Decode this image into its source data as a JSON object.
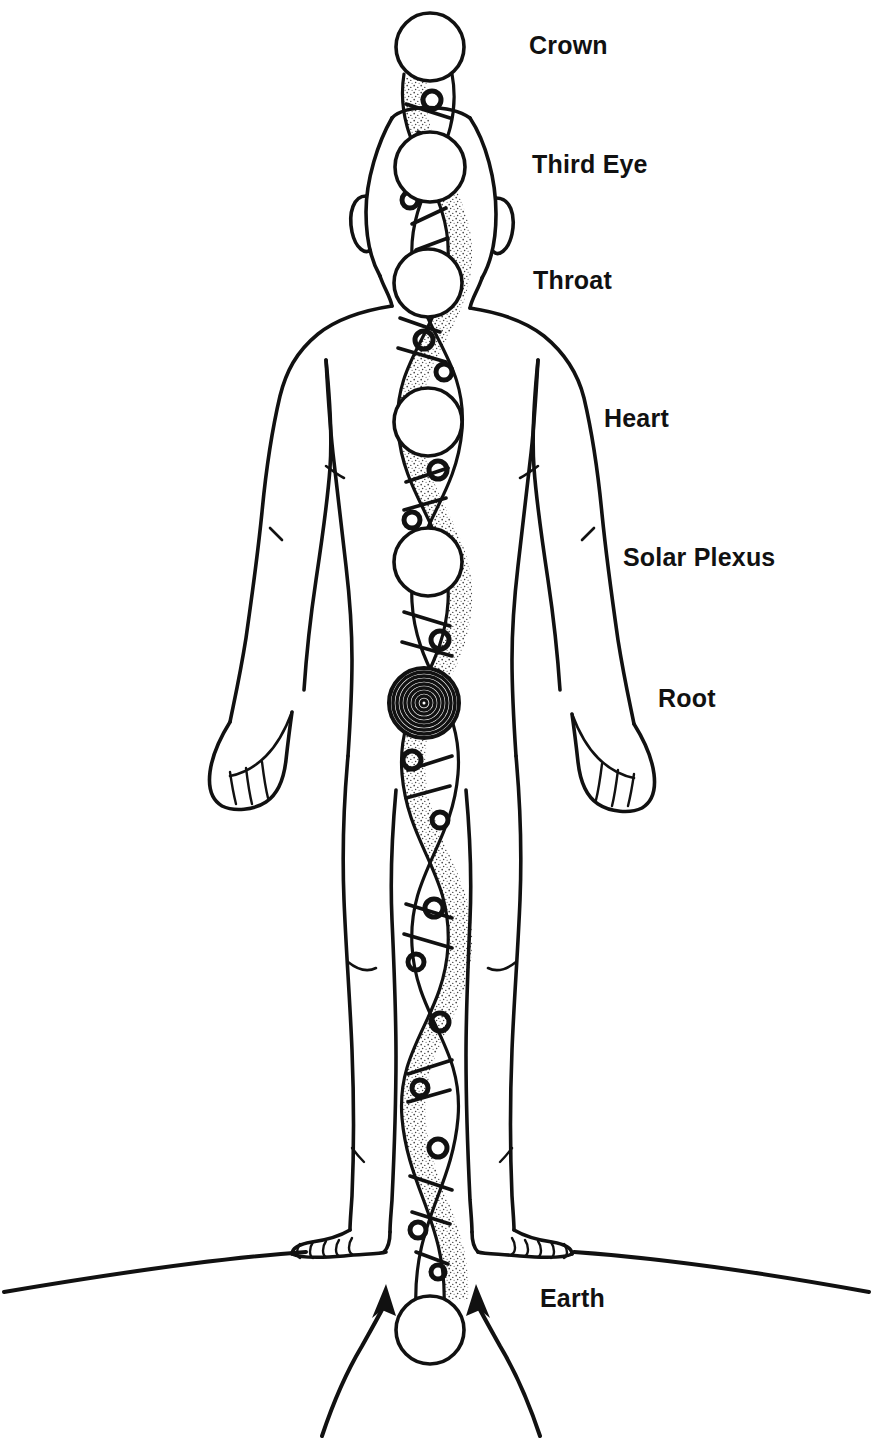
{
  "diagram": {
    "background_color": "#ffffff",
    "ink_color": "#111111"
  },
  "labels": {
    "crown": "Crown",
    "third_eye": "Third Eye",
    "throat": "Throat",
    "heart": "Heart",
    "solar_plexus": "Solar Plexus",
    "root": "Root",
    "earth": "Earth"
  },
  "chakras": [
    {
      "name": "Crown",
      "label": "Crown",
      "marker": "open-circle",
      "cx": 430,
      "cy": 47,
      "r": 34,
      "label_x": 529,
      "label_y": 33
    },
    {
      "name": "Third Eye",
      "label": "Third Eye",
      "marker": "open-circle",
      "cx": 430,
      "cy": 167,
      "r": 35,
      "label_x": 532,
      "label_y": 152
    },
    {
      "name": "Throat",
      "label": "Throat",
      "marker": "open-circle",
      "cx": 428,
      "cy": 283,
      "r": 34,
      "label_x": 533,
      "label_y": 268
    },
    {
      "name": "Heart",
      "label": "Heart",
      "marker": "open-circle",
      "cx": 428,
      "cy": 422,
      "r": 34,
      "label_x": 604,
      "label_y": 406
    },
    {
      "name": "Solar Plexus",
      "label": "Solar Plexus",
      "marker": "open-circle",
      "cx": 428,
      "cy": 562,
      "r": 34,
      "label_x": 623,
      "label_y": 545
    },
    {
      "name": "Root",
      "label": "Root",
      "marker": "concentric-rings",
      "cx": 424,
      "cy": 703,
      "r": 34,
      "label_x": 658,
      "label_y": 686,
      "ring_count": 8
    },
    {
      "name": "Earth",
      "label": "Earth",
      "marker": "open-circle",
      "cx": 430,
      "cy": 1330,
      "r": 34,
      "label_x": 540,
      "label_y": 1286
    }
  ],
  "elements": {
    "helix": "double-helix energy column",
    "ground_line": "earth-horizon-line",
    "arrows": [
      {
        "name": "left-energy-arrow",
        "direction": "up-right"
      },
      {
        "name": "right-energy-arrow",
        "direction": "up-left"
      }
    ]
  }
}
